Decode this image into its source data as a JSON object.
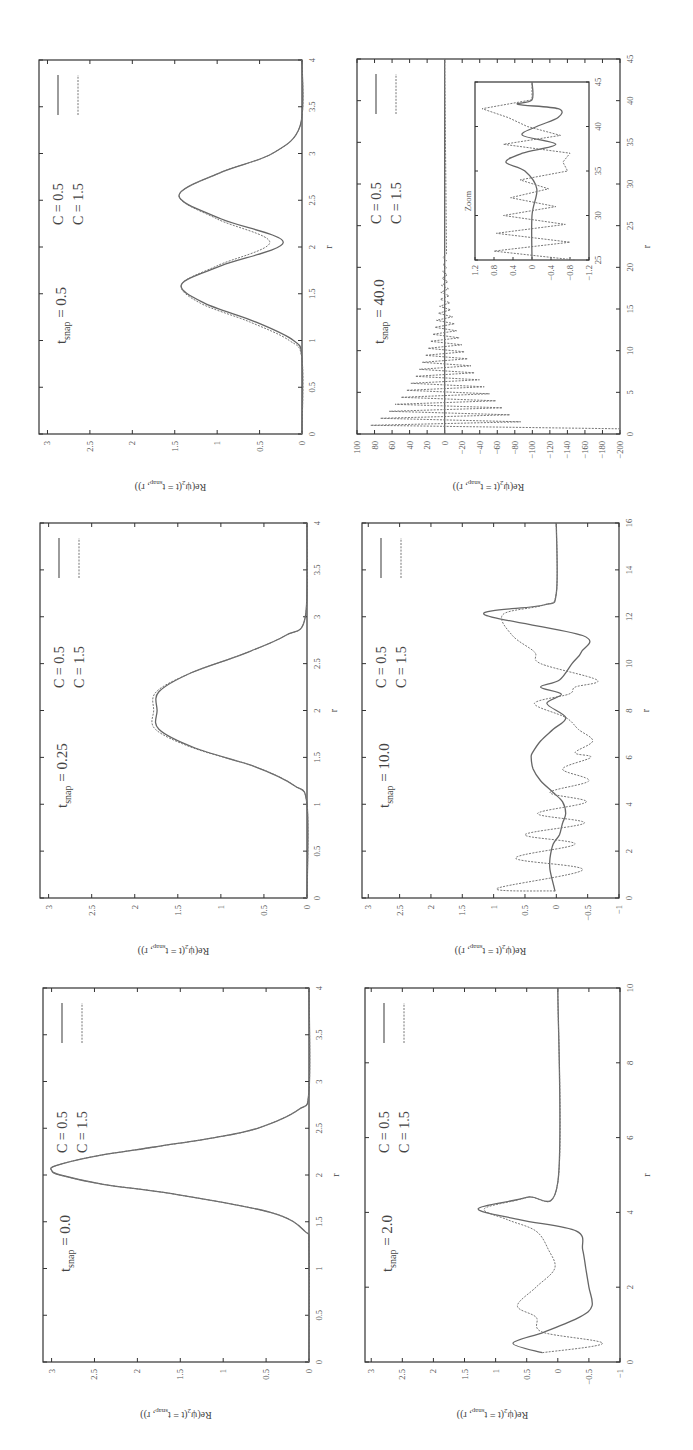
{
  "figure": {
    "orientation": "rotated 90 degrees (landscape figure displayed on portrait page)",
    "layout": "3 rows x 2 columns of panels",
    "y_axis_label": "Re(ψ₂(t = t_snap, r))",
    "x_axis_label": "r",
    "legend": [
      {
        "label": "C = 0.5",
        "style": "solid"
      },
      {
        "label": "C = 1.5",
        "style": "dashed"
      }
    ],
    "colors": {
      "solid": "#666666",
      "dashed": "#777777",
      "frame": "#333333"
    }
  },
  "chart_data": [
    {
      "type": "line",
      "panel": "t_snap = 0.0",
      "annotation": "t_snap = 0.0",
      "xlabel": "r",
      "ylabel": "Re(ψ₂(t = t_snap, r))",
      "xlim": [
        0,
        4
      ],
      "ylim": [
        0,
        3.1
      ],
      "xticks": [
        "0",
        "0.5",
        "1",
        "1.5",
        "2",
        "2.5",
        "3",
        "3.5",
        "4"
      ],
      "yticks": [
        "0",
        "0.5",
        "1",
        "1.5",
        "2",
        "2.5",
        "3"
      ],
      "x": [
        0,
        1.2,
        1.4,
        1.6,
        1.8,
        1.9,
        2.0,
        2.05,
        2.1,
        2.2,
        2.3,
        2.4,
        2.5,
        2.7,
        2.9,
        4
      ],
      "series": [
        {
          "name": "C = 0.5",
          "values": [
            0,
            0,
            0.05,
            0.45,
            1.6,
            2.4,
            2.9,
            3.0,
            2.95,
            2.5,
            1.8,
            1.1,
            0.6,
            0.12,
            0,
            0
          ]
        },
        {
          "name": "C = 1.5",
          "values": [
            0,
            0,
            0.05,
            0.45,
            1.6,
            2.4,
            2.9,
            3.0,
            2.95,
            2.5,
            1.8,
            1.1,
            0.6,
            0.12,
            0,
            0
          ]
        }
      ],
      "legend_position": "upper right"
    },
    {
      "type": "line",
      "panel": "t_snap = 0.25",
      "annotation": "t_snap = 0.25",
      "xlabel": "r",
      "ylabel": "Re(ψ₂(t = t_snap, r))",
      "xlim": [
        0,
        4
      ],
      "ylim": [
        0,
        3.1
      ],
      "xticks": [
        "0",
        "0.5",
        "1",
        "1.5",
        "2",
        "2.5",
        "3",
        "3.5",
        "4"
      ],
      "yticks": [
        "0",
        "0.5",
        "1",
        "1.5",
        "2",
        "2.5",
        "3"
      ],
      "x": [
        0,
        1.0,
        1.2,
        1.4,
        1.6,
        1.8,
        2.0,
        2.2,
        2.4,
        2.6,
        2.8,
        3.0,
        4
      ],
      "series": [
        {
          "name": "C = 0.5",
          "values": [
            0,
            0,
            0.15,
            0.6,
            1.3,
            1.72,
            1.74,
            1.72,
            1.35,
            0.75,
            0.25,
            0.02,
            0
          ]
        },
        {
          "name": "C = 1.5",
          "values": [
            0,
            0,
            0.15,
            0.6,
            1.32,
            1.76,
            1.78,
            1.75,
            1.35,
            0.75,
            0.25,
            0.02,
            0
          ]
        }
      ],
      "legend_position": "upper right"
    },
    {
      "type": "line",
      "panel": "t_snap = 0.5",
      "annotation": "t_snap = 0.5",
      "xlabel": "r",
      "ylabel": "Re(ψ₂(t = t_snap, r))",
      "xlim": [
        0,
        4
      ],
      "ylim": [
        0,
        3.1
      ],
      "xticks": [
        "0",
        "0.5",
        "1",
        "1.5",
        "2",
        "2.5",
        "3",
        "3.5",
        "4"
      ],
      "yticks": [
        "0",
        "0.5",
        "1",
        "1.5",
        "2",
        "2.5",
        "3"
      ],
      "x": [
        0,
        0.8,
        1.0,
        1.2,
        1.4,
        1.6,
        1.8,
        2.05,
        2.3,
        2.55,
        2.8,
        3.0,
        3.3,
        4
      ],
      "series": [
        {
          "name": "C = 0.5",
          "values": [
            0,
            0,
            0.1,
            0.55,
            1.15,
            1.42,
            0.95,
            0.22,
            0.95,
            1.45,
            0.95,
            0.35,
            0.02,
            0
          ]
        },
        {
          "name": "C = 1.5",
          "values": [
            0,
            0,
            0.15,
            0.62,
            1.2,
            1.42,
            1.0,
            0.38,
            1.0,
            1.45,
            0.95,
            0.35,
            0.02,
            0
          ]
        }
      ],
      "legend_position": "upper right"
    },
    {
      "type": "line",
      "panel": "t_snap = 2.0",
      "annotation": "t_snap = 2.0",
      "xlabel": "r",
      "ylabel": "Re(ψ₂(t = t_snap, r))",
      "xlim": [
        0,
        10
      ],
      "ylim": [
        -1,
        3.1
      ],
      "xticks": [
        "0",
        "2",
        "4",
        "6",
        "8",
        "10"
      ],
      "yticks": [
        "-1",
        "-0.5",
        "0",
        "0.5",
        "1",
        "1.5",
        "2",
        "2.5",
        "3"
      ],
      "x": [
        0.25,
        0.5,
        0.8,
        1.2,
        1.5,
        2.0,
        2.5,
        3.0,
        3.5,
        3.8,
        4.1,
        4.4,
        4.8,
        10
      ],
      "series": [
        {
          "name": "C = 0.5",
          "values": [
            0.25,
            0.72,
            0.22,
            -0.35,
            -0.55,
            -0.5,
            -0.45,
            -0.4,
            -0.3,
            0.6,
            1.28,
            0.5,
            0,
            0
          ]
        },
        {
          "name": "C = 1.5",
          "values": [
            0.25,
            -0.72,
            0.25,
            0.35,
            0.65,
            0.35,
            0.05,
            0.15,
            0.35,
            0.8,
            1.18,
            0.5,
            0,
            0
          ]
        }
      ],
      "legend_position": "upper right"
    },
    {
      "type": "line",
      "panel": "t_snap = 10.0",
      "annotation": "t_snap = 10.0",
      "xlabel": "r",
      "ylabel": "Re(ψ₂(t = t_snap, r))",
      "xlim": [
        0,
        16
      ],
      "ylim": [
        -1,
        3.1
      ],
      "xticks": [
        "0",
        "2",
        "4",
        "6",
        "8",
        "10",
        "12",
        "14",
        "16"
      ],
      "yticks": [
        "-1",
        "-0.5",
        "0",
        "0.5",
        "1",
        "1.5",
        "2",
        "2.5",
        "3"
      ],
      "x": [
        0.3,
        0.4,
        1.2,
        1.7,
        2.3,
        2.7,
        3.2,
        3.6,
        4.1,
        4.5,
        5.0,
        5.5,
        6.0,
        6.2,
        6.7,
        7.2,
        7.7,
        8.3,
        8.7,
        9.0,
        9.3,
        10.0,
        10.5,
        11.2,
        12.1,
        12.5,
        13,
        16
      ],
      "series": [
        {
          "name": "C = 0.5",
          "values": [
            0.02,
            0.03,
            0.1,
            0.1,
            0.05,
            -0.05,
            -0.1,
            -0.15,
            -0.1,
            0.05,
            0.25,
            0.37,
            0.4,
            0.38,
            0.25,
            0.05,
            -0.15,
            0.15,
            -0.08,
            0.25,
            -0.05,
            -0.25,
            -0.4,
            -0.42,
            1.15,
            0.2,
            0,
            0
          ]
        },
        {
          "name": "C = 1.5",
          "values": [
            0.02,
            0.95,
            -0.42,
            0.65,
            -0.3,
            0.5,
            -0.45,
            0.3,
            -0.48,
            0.1,
            -0.52,
            -0.1,
            -0.55,
            -0.3,
            -0.58,
            -0.35,
            -0.15,
            0.35,
            -0.2,
            -0.3,
            -0.65,
            0.25,
            0.35,
            0.7,
            0.85,
            0.2,
            0,
            0
          ]
        }
      ],
      "legend_position": "upper right"
    },
    {
      "type": "line",
      "panel": "t_snap = 40.0",
      "annotation": "t_snap = 40.0",
      "xlabel": "r",
      "ylabel": "Re(ψ₂(t = t_snap, r))",
      "xlim": [
        0,
        45
      ],
      "ylim": [
        -200,
        100
      ],
      "xticks": [
        "0",
        "5",
        "10",
        "15",
        "20",
        "25",
        "30",
        "35",
        "40",
        "45"
      ],
      "yticks": [
        "-200",
        "-180",
        "-160",
        "-140",
        "-120",
        "-100",
        "-80",
        "-60",
        "-40",
        "-20",
        "0",
        "20",
        "40",
        "60",
        "80",
        "100"
      ],
      "series": [
        {
          "name": "C = 0.5",
          "description": "approximately 0 across full range",
          "x": [
            0,
            45
          ],
          "values": [
            0,
            0
          ]
        },
        {
          "name": "C = 1.5",
          "description": "rapid oscillation with decaying envelope; max ~ +85 near r=1, min ~ -200 near r=0.5, amplitude ~ ±10 by r=15, negligible beyond r~20",
          "envelope_x": [
            0.5,
            1,
            2.5,
            5,
            7.5,
            10,
            12.5,
            15,
            20,
            45
          ],
          "envelope_amp": [
            200,
            85,
            65,
            45,
            30,
            20,
            12,
            6,
            2,
            0
          ]
        }
      ],
      "inset": {
        "title": "Zoom",
        "xlim": [
          25,
          45
        ],
        "ylim": [
          -1.2,
          1.2
        ],
        "xticks": [
          "25",
          "30",
          "35",
          "40",
          "45"
        ],
        "yticks": [
          "-1.2",
          "-0.8",
          "-0.4",
          "0",
          "0.4",
          "0.8",
          "1.2"
        ],
        "series": [
          {
            "name": "C = 0.5",
            "x": [
              25,
              30,
              33,
              35,
              36,
              37,
              38,
              39,
              40,
              41,
              42,
              42.5,
              43,
              45
            ],
            "values": [
              0,
              0,
              -0.1,
              0.15,
              0.55,
              0.2,
              -0.5,
              0.2,
              -0.1,
              -0.55,
              -0.55,
              0.3,
              0,
              0
            ]
          },
          {
            "name": "C = 1.5",
            "x": [
              25,
              26,
              27,
              28,
              29,
              30,
              31,
              32,
              33,
              34,
              35,
              36,
              37,
              38,
              39,
              40,
              41,
              42,
              43,
              45
            ],
            "values": [
              -0.9,
              0.8,
              -0.8,
              0.75,
              -0.7,
              0.6,
              -0.5,
              0.45,
              -0.35,
              0.25,
              -0.75,
              -0.65,
              -0.8,
              0.6,
              -0.6,
              0.1,
              0.5,
              1.05,
              0,
              0
            ]
          }
        ]
      },
      "legend_position": "upper right"
    }
  ],
  "panels": [
    {
      "id": "p05",
      "t_label": "0.5",
      "box": [
        39,
        60,
        302,
        434
      ],
      "xr": [
        0,
        4
      ],
      "yr": [
        0,
        3.1
      ],
      "xt": [
        0,
        0.5,
        1,
        1.5,
        2,
        2.5,
        3,
        3.5,
        4
      ],
      "xtl": [
        "0",
        "0.5",
        "1",
        "1.5",
        "2",
        "2.5",
        "3",
        "3.5",
        "4"
      ],
      "yt": [
        0,
        0.5,
        1,
        1.5,
        2,
        2.5,
        3
      ],
      "ytl": [
        "0",
        "0.5",
        "1",
        "1.5",
        "2",
        "2.5",
        "3"
      ]
    },
    {
      "id": "p40",
      "t_label": "40.0",
      "box": [
        357,
        59,
        620,
        434
      ],
      "xr": [
        0,
        45
      ],
      "yr": [
        -200,
        100
      ],
      "xt": [
        0,
        5,
        10,
        15,
        20,
        25,
        30,
        35,
        40,
        45
      ],
      "xtl": [
        "0",
        "5",
        "10",
        "15",
        "20",
        "25",
        "30",
        "35",
        "40",
        "45"
      ],
      "yt": [
        -200,
        -180,
        -160,
        -140,
        -120,
        -100,
        -80,
        -60,
        -40,
        -20,
        0,
        20,
        40,
        60,
        80,
        100
      ],
      "ytl": [
        "−200",
        "−180",
        "−160",
        "−140",
        "−120",
        "−100",
        "−80",
        "−60",
        "−40",
        "−20",
        "0",
        "20",
        "40",
        "60",
        "80",
        "100"
      ]
    },
    {
      "id": "p025",
      "t_label": "0.25",
      "box": [
        40,
        523,
        307,
        898
      ],
      "xr": [
        0,
        4
      ],
      "yr": [
        0,
        3.1
      ],
      "xt": [
        0,
        0.5,
        1,
        1.5,
        2,
        2.5,
        3,
        3.5,
        4
      ],
      "xtl": [
        "0",
        "0.5",
        "1",
        "1.5",
        "2",
        "2.5",
        "3",
        "3.5",
        "4"
      ],
      "yt": [
        0,
        0.5,
        1,
        1.5,
        2,
        2.5,
        3
      ],
      "ytl": [
        "0",
        "0.5",
        "1",
        "1.5",
        "2",
        "2.5",
        "3"
      ]
    },
    {
      "id": "p10",
      "t_label": "10.0",
      "box": [
        362,
        523,
        619,
        898
      ],
      "xr": [
        0,
        16
      ],
      "yr": [
        -1,
        3.1
      ],
      "xt": [
        0,
        2,
        4,
        6,
        8,
        10,
        12,
        14,
        16
      ],
      "xtl": [
        "0",
        "2",
        "4",
        "6",
        "8",
        "10",
        "12",
        "14",
        "16"
      ],
      "yt": [
        -1,
        -0.5,
        0,
        0.5,
        1,
        1.5,
        2,
        2.5,
        3
      ],
      "ytl": [
        "−1",
        "−0.5",
        "0",
        "0.5",
        "1",
        "1.5",
        "2",
        "2.5",
        "3"
      ]
    },
    {
      "id": "p00",
      "t_label": "0.0",
      "box": [
        43,
        988,
        309,
        1362
      ],
      "xr": [
        0,
        4
      ],
      "yr": [
        0,
        3.1
      ],
      "xt": [
        0,
        0.5,
        1,
        1.5,
        2,
        2.5,
        3,
        3.5,
        4
      ],
      "xtl": [
        "0",
        "0.5",
        "1",
        "1.5",
        "2",
        "2.5",
        "3",
        "3.5",
        "4"
      ],
      "yt": [
        0,
        0.5,
        1,
        1.5,
        2,
        2.5,
        3
      ],
      "ytl": [
        "0",
        "0.5",
        "1",
        "1.5",
        "2",
        "2.5",
        "3"
      ]
    },
    {
      "id": "p20",
      "t_label": "2.0",
      "box": [
        365,
        988,
        620,
        1362
      ],
      "xr": [
        0,
        10
      ],
      "yr": [
        -1,
        3.1
      ],
      "xt": [
        0,
        2,
        4,
        6,
        8,
        10
      ],
      "xtl": [
        "0",
        "2",
        "4",
        "6",
        "8",
        "10"
      ],
      "yt": [
        -1,
        -0.5,
        0,
        0.5,
        1,
        1.5,
        2,
        2.5,
        3
      ],
      "ytl": [
        "−1",
        "−0.5",
        "0",
        "0.5",
        "1",
        "1.5",
        "2",
        "2.5",
        "3"
      ]
    }
  ],
  "labels": {
    "t_prefix": "t",
    "t_sub": "snap",
    "t_eq": " = ",
    "legend1": "C = 0.5",
    "legend2": "C = 1.5",
    "xlabel": "r",
    "ylabel_main": "Re(ψ",
    "ylabel_sub2": "2",
    "ylabel_mid": "(t = t",
    "ylabel_sub": "snap",
    "ylabel_end": ", r))",
    "inset_title": "Zoom"
  }
}
